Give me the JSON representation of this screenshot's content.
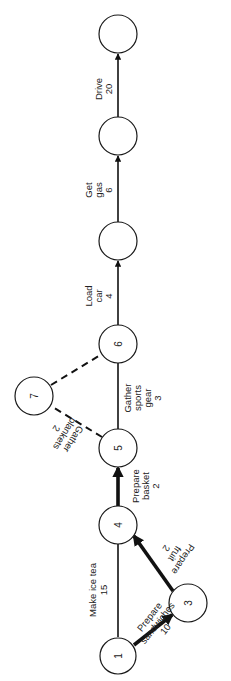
{
  "diagram": {
    "type": "activity network (PERT), rotated 90° counter-clockwise",
    "nodes": [
      {
        "id": "n1",
        "label": "1",
        "x": 118,
        "y": 656
      },
      {
        "id": "n3",
        "label": "3",
        "x": 188,
        "y": 603
      },
      {
        "id": "n4",
        "label": "4",
        "x": 118,
        "y": 525
      },
      {
        "id": "n5",
        "label": "5",
        "x": 118,
        "y": 448
      },
      {
        "id": "n6",
        "label": "6",
        "x": 118,
        "y": 344
      },
      {
        "id": "n7",
        "label": "7",
        "x": 34,
        "y": 396
      },
      {
        "id": "n8",
        "label": "",
        "x": 118,
        "y": 241
      },
      {
        "id": "n9",
        "label": "",
        "x": 118,
        "y": 136
      },
      {
        "id": "n10",
        "label": "",
        "x": 118,
        "y": 34
      }
    ],
    "edges": [
      {
        "from": "n1",
        "to": "n4",
        "name": "Make ice tea",
        "duration": "15",
        "style": "thin",
        "arrow": false,
        "label_lines": [
          "Make ice tea",
          "15"
        ]
      },
      {
        "from": "n1",
        "to": "n3",
        "name": "Prepare sandwiches",
        "duration": "10",
        "style": "critical",
        "arrow": true,
        "label_lines": [
          "Prepare",
          "sandwiches",
          "10"
        ]
      },
      {
        "from": "n3",
        "to": "n4",
        "name": "Prepare fruit",
        "duration": "2",
        "style": "critical",
        "arrow": true,
        "label_lines": [
          "Prepare",
          "fruit",
          "2"
        ]
      },
      {
        "from": "n4",
        "to": "n5",
        "name": "Prepare basket",
        "duration": "2",
        "style": "critical",
        "arrow": true,
        "label_lines": [
          "Prepare",
          "basket",
          "2"
        ]
      },
      {
        "from": "n5",
        "to": "n6",
        "name": "Gather sports gear",
        "duration": "3",
        "style": "thin",
        "arrow": false,
        "label_lines": [
          "Gather",
          "sports",
          "gear",
          "3"
        ]
      },
      {
        "from": "n5",
        "to": "n7",
        "name": "Gather blankets",
        "duration": "2",
        "style": "dashed",
        "arrow": false,
        "label_lines": [
          "Gather",
          "blankets",
          "2"
        ]
      },
      {
        "from": "n7",
        "to": "n6",
        "name": "",
        "duration": "",
        "style": "dashed",
        "arrow": false,
        "label_lines": []
      },
      {
        "from": "n6",
        "to": "n8",
        "name": "Load car",
        "duration": "4",
        "style": "thin",
        "arrow": true,
        "label_lines": [
          "Load",
          "car",
          "4"
        ]
      },
      {
        "from": "n8",
        "to": "n9",
        "name": "Get gas",
        "duration": "6",
        "style": "thin",
        "arrow": true,
        "label_lines": [
          "Get",
          "gas",
          "6"
        ]
      },
      {
        "from": "n9",
        "to": "n10",
        "name": "Drive",
        "duration": "20",
        "style": "thin",
        "arrow": true,
        "label_lines": [
          "Drive",
          "20"
        ]
      }
    ]
  }
}
